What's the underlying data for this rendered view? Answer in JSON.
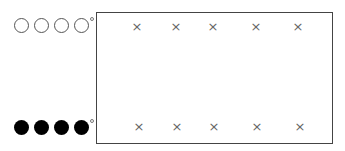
{
  "legend": {
    "top_row": {
      "style": "open",
      "count": 4,
      "marker": "degree-sign"
    },
    "bottom_row": {
      "style": "filled",
      "count": 4,
      "marker": "degree-sign"
    }
  },
  "box": {
    "top_row_marks": [
      "×",
      "×",
      "×",
      "×",
      "×"
    ],
    "bottom_row_marks": [
      "×",
      "×",
      "×",
      "×",
      "×"
    ]
  }
}
